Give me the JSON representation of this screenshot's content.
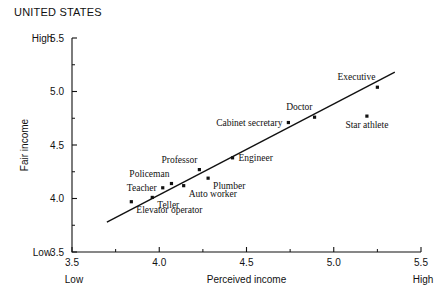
{
  "chart_data": {
    "type": "scatter",
    "title": "UNITED STATES",
    "xlabel": "Perceived income",
    "ylabel": "Fair income",
    "xlim": [
      3.5,
      5.5
    ],
    "ylim": [
      3.5,
      5.5
    ],
    "grid": false,
    "legend": null,
    "x_ticks": [
      "3.5",
      "4.0",
      "4.5",
      "5.0",
      "5.5"
    ],
    "x_tick_values": [
      3.5,
      4.0,
      4.5,
      5.0,
      5.5
    ],
    "y_ticks": [
      "3.5",
      "4.0",
      "4.5",
      "5.0",
      "5.5"
    ],
    "y_tick_values": [
      3.5,
      4.0,
      4.5,
      5.0,
      5.5
    ],
    "x_minor_values": [
      3.75,
      4.25,
      4.75,
      5.25
    ],
    "y_minor_values": [
      3.75,
      4.25,
      4.75,
      5.25
    ],
    "axis_anchors": {
      "x_low": "Low",
      "x_high": "High",
      "y_low": "Low",
      "y_high": "High"
    },
    "points": [
      {
        "label": "Elevator operator",
        "x": 3.84,
        "y": 3.97,
        "label_pos": "below-right"
      },
      {
        "label": "Teller",
        "x": 3.96,
        "y": 4.01,
        "label_pos": "below-right"
      },
      {
        "label": "Teacher",
        "x": 4.02,
        "y": 4.1,
        "label_pos": "left"
      },
      {
        "label": "Policeman",
        "x": 4.07,
        "y": 4.14,
        "label_pos": "above-left"
      },
      {
        "label": "Auto worker",
        "x": 4.14,
        "y": 4.12,
        "label_pos": "below-right"
      },
      {
        "label": "Professor",
        "x": 4.23,
        "y": 4.27,
        "label_pos": "above-left"
      },
      {
        "label": "Plumber",
        "x": 4.28,
        "y": 4.19,
        "label_pos": "below-right"
      },
      {
        "label": "Engineer",
        "x": 4.42,
        "y": 4.38,
        "label_pos": "right"
      },
      {
        "label": "Cabinet secretary",
        "x": 4.74,
        "y": 4.71,
        "label_pos": "left"
      },
      {
        "label": "Doctor",
        "x": 4.89,
        "y": 4.76,
        "label_pos": "above-left"
      },
      {
        "label": "Star athlete",
        "x": 5.19,
        "y": 4.77,
        "label_pos": "below"
      },
      {
        "label": "Executive",
        "x": 5.25,
        "y": 5.04,
        "label_pos": "above-left"
      }
    ],
    "fit_line": {
      "x_start": 3.7,
      "y_start": 3.78,
      "x_end": 5.35,
      "y_end": 5.18
    },
    "colors": {
      "marker": "#111111",
      "line": "#111111",
      "axis": "#111111",
      "background": "#ffffff"
    }
  }
}
